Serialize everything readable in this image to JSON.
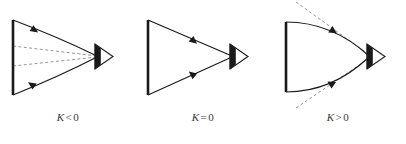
{
  "figure": {
    "panels": [
      {
        "id": "negative",
        "label_symbol": "K",
        "label_operator": "<",
        "label_value": "0",
        "label_text": "K<0",
        "curvature": "negative",
        "edge_style": "concave",
        "has_dashed_lines": true,
        "dashed_line_role": "interior-straight-chords",
        "apex_icon": "right-pointing-arrowhead",
        "arrow_upper_direction": "toward-apex",
        "arrow_lower_direction": "toward-base"
      },
      {
        "id": "zero",
        "label_symbol": "K",
        "label_operator": "=",
        "label_value": "0",
        "label_text": "K=0",
        "curvature": "zero",
        "edge_style": "straight",
        "has_dashed_lines": false,
        "dashed_line_role": "none",
        "apex_icon": "right-pointing-arrowhead",
        "arrow_upper_direction": "toward-apex",
        "arrow_lower_direction": "toward-base"
      },
      {
        "id": "positive",
        "label_symbol": "K",
        "label_operator": ">",
        "label_value": "0",
        "label_text": "K>0",
        "curvature": "positive",
        "edge_style": "convex",
        "has_dashed_lines": true,
        "dashed_line_role": "exterior-tangent-lines",
        "apex_icon": "right-pointing-arrowhead",
        "arrow_upper_direction": "toward-apex",
        "arrow_lower_direction": "toward-base"
      }
    ]
  },
  "colors": {
    "background": "#ffffff",
    "stroke": "#1a1a1a",
    "dashed_stroke": "#8a8a8a",
    "label_text": "#3a3a3a"
  }
}
